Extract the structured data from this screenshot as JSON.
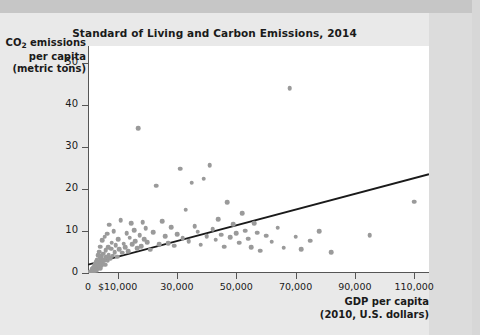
{
  "figure": {
    "title": "Standard of Living and Carbon Emissions, 2014",
    "y_axis_title_lines": [
      "CO2 emissions",
      "per capita",
      "(metric tons)"
    ],
    "x_axis_title_lines": [
      "GDP per capita",
      "(2010, U.S. dollars)"
    ]
  },
  "colors": {
    "point": "#9a9a9a",
    "trend_line": "#1a1a1a",
    "axis": "#555555",
    "plot_background": "#ffffff",
    "page_background": "#e9e9e9"
  },
  "chart_data": {
    "type": "scatter",
    "title": "Standard of Living and Carbon Emissions, 2014",
    "xlabel": "GDP per capita (2010, U.S. dollars)",
    "ylabel": "CO2 emissions per capita (metric tons)",
    "xlim": [
      0,
      115000
    ],
    "ylim": [
      0,
      54
    ],
    "xticks": [
      0,
      10000,
      30000,
      50000,
      70000,
      90000,
      110000
    ],
    "xtick_labels": [
      "0",
      "$10,000",
      "30,000",
      "50,000",
      "70,000",
      "90,000",
      "110,000"
    ],
    "yticks": [
      0,
      10,
      20,
      30,
      40,
      50
    ],
    "ytick_labels": [
      "0",
      "10",
      "20",
      "30",
      "40",
      "50"
    ],
    "grid": false,
    "legend": "none",
    "trend_line": {
      "label": "linear trend",
      "x": [
        0,
        115000
      ],
      "y": [
        2.0,
        23.5
      ]
    },
    "points": [
      [
        800,
        0.3
      ],
      [
        1000,
        0.2
      ],
      [
        1200,
        0.5
      ],
      [
        1400,
        0.4
      ],
      [
        1500,
        0.9
      ],
      [
        1700,
        0.6
      ],
      [
        1800,
        1.1
      ],
      [
        1900,
        0.3
      ],
      [
        2000,
        1.4
      ],
      [
        2100,
        0.7
      ],
      [
        2200,
        1.8
      ],
      [
        2300,
        0.5
      ],
      [
        2400,
        2.1
      ],
      [
        2500,
        1.2
      ],
      [
        2600,
        0.8
      ],
      [
        2700,
        2.6
      ],
      [
        2800,
        1.5
      ],
      [
        2900,
        0.6
      ],
      [
        3000,
        3.1
      ],
      [
        3100,
        1.9
      ],
      [
        3200,
        1.0
      ],
      [
        3300,
        2.4
      ],
      [
        3400,
        4.2
      ],
      [
        3500,
        1.3
      ],
      [
        3600,
        2.0
      ],
      [
        3700,
        5.1
      ],
      [
        3800,
        1.6
      ],
      [
        3900,
        2.8
      ],
      [
        4000,
        3.6
      ],
      [
        4100,
        1.1
      ],
      [
        4200,
        6.3
      ],
      [
        4300,
        2.2
      ],
      [
        4400,
        4.0
      ],
      [
        4500,
        1.7
      ],
      [
        4600,
        3.3
      ],
      [
        4800,
        7.8
      ],
      [
        5000,
        2.5
      ],
      [
        5200,
        4.6
      ],
      [
        5400,
        3.0
      ],
      [
        5600,
        8.6
      ],
      [
        5800,
        2.0
      ],
      [
        6000,
        5.4
      ],
      [
        6200,
        3.8
      ],
      [
        6400,
        9.3
      ],
      [
        6600,
        2.9
      ],
      [
        6800,
        6.1
      ],
      [
        7000,
        4.3
      ],
      [
        7200,
        11.5
      ],
      [
        7500,
        3.5
      ],
      [
        7800,
        5.8
      ],
      [
        8000,
        7.2
      ],
      [
        8300,
        4.1
      ],
      [
        8600,
        9.9
      ],
      [
        9000,
        5.0
      ],
      [
        9400,
        6.6
      ],
      [
        9800,
        3.9
      ],
      [
        10200,
        8.1
      ],
      [
        10600,
        5.6
      ],
      [
        11000,
        12.6
      ],
      [
        11500,
        4.8
      ],
      [
        12000,
        7.0
      ],
      [
        12500,
        6.2
      ],
      [
        13000,
        9.5
      ],
      [
        13500,
        5.2
      ],
      [
        14000,
        8.4
      ],
      [
        14500,
        11.9
      ],
      [
        15000,
        6.8
      ],
      [
        15500,
        10.2
      ],
      [
        16000,
        7.5
      ],
      [
        16500,
        5.9
      ],
      [
        17000,
        34.5
      ],
      [
        17500,
        9.0
      ],
      [
        18000,
        6.4
      ],
      [
        18500,
        12.1
      ],
      [
        19000,
        8.0
      ],
      [
        19500,
        10.6
      ],
      [
        20000,
        7.3
      ],
      [
        21000,
        5.5
      ],
      [
        22000,
        9.7
      ],
      [
        23000,
        20.8
      ],
      [
        24000,
        6.9
      ],
      [
        25000,
        12.3
      ],
      [
        26000,
        8.8
      ],
      [
        27000,
        7.1
      ],
      [
        28000,
        10.9
      ],
      [
        29000,
        6.5
      ],
      [
        30000,
        9.2
      ],
      [
        31000,
        24.8
      ],
      [
        32000,
        8.3
      ],
      [
        33000,
        15.1
      ],
      [
        34000,
        7.6
      ],
      [
        35000,
        21.5
      ],
      [
        36000,
        11.2
      ],
      [
        37000,
        9.8
      ],
      [
        38000,
        6.7
      ],
      [
        39000,
        22.4
      ],
      [
        40000,
        8.7
      ],
      [
        41000,
        25.6
      ],
      [
        42000,
        10.4
      ],
      [
        43000,
        7.9
      ],
      [
        44000,
        12.8
      ],
      [
        45000,
        9.1
      ],
      [
        46000,
        6.3
      ],
      [
        47000,
        16.9
      ],
      [
        48000,
        8.5
      ],
      [
        49000,
        11.6
      ],
      [
        50000,
        9.4
      ],
      [
        51000,
        7.2
      ],
      [
        52000,
        14.2
      ],
      [
        53000,
        10.1
      ],
      [
        54000,
        8.2
      ],
      [
        55000,
        6.1
      ],
      [
        56000,
        11.8
      ],
      [
        57000,
        9.6
      ],
      [
        58000,
        5.3
      ],
      [
        60000,
        8.9
      ],
      [
        62000,
        7.4
      ],
      [
        64000,
        10.8
      ],
      [
        66000,
        6.0
      ],
      [
        68000,
        44.0
      ],
      [
        70000,
        8.6
      ],
      [
        72000,
        5.7
      ],
      [
        75000,
        7.7
      ],
      [
        78000,
        9.9
      ],
      [
        82000,
        4.9
      ],
      [
        95000,
        9.0
      ],
      [
        110000,
        17.0
      ]
    ]
  }
}
